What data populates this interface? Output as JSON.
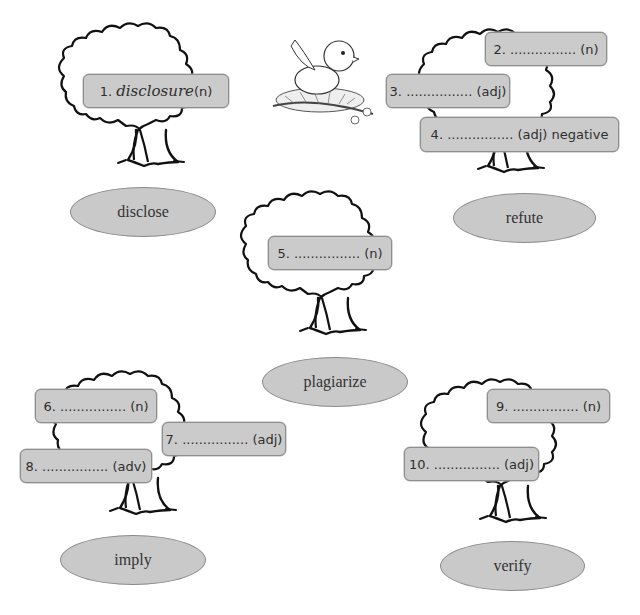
{
  "worksheet": {
    "trees": [
      {
        "root_word": "disclose",
        "blanks": [
          {
            "number": "1.",
            "answer": "disclosure",
            "pos": "(n)"
          }
        ]
      },
      {
        "root_word": "refute",
        "blanks": [
          {
            "number": "2.",
            "dots": "................",
            "pos": "(n)"
          },
          {
            "number": "3.",
            "dots": "................",
            "pos": "(adj)"
          },
          {
            "number": "4.",
            "dots": "................",
            "pos": "(adj) negative"
          }
        ]
      },
      {
        "root_word": "plagiarize",
        "blanks": [
          {
            "number": "5.",
            "dots": "................",
            "pos": "(n)"
          }
        ]
      },
      {
        "root_word": "imply",
        "blanks": [
          {
            "number": "6.",
            "dots": "................",
            "pos": "(n)"
          },
          {
            "number": "7.",
            "dots": "................",
            "pos": "(adj)"
          },
          {
            "number": "8.",
            "dots": "................",
            "pos": "(adv)"
          }
        ]
      },
      {
        "root_word": "verify",
        "blanks": [
          {
            "number": "9.",
            "dots": "................",
            "pos": "(n)"
          },
          {
            "number": "10.",
            "dots": "................",
            "pos": "(adj)"
          }
        ]
      }
    ],
    "illustration": "bird-in-nest",
    "colors": {
      "box_fill": "#cbcbcb",
      "box_border": "#8e8e8e",
      "oval_fill": "#c9c9c9",
      "outline": "#111111"
    }
  }
}
